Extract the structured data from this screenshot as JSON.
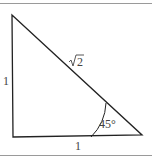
{
  "diagram": {
    "type": "right-triangle",
    "vertices": {
      "top_left": [
        12,
        15
      ],
      "bottom_left": [
        13,
        137
      ],
      "bottom_right": [
        142,
        135
      ]
    },
    "labels": {
      "left_side": "1",
      "bottom_side": "1",
      "hypotenuse_radicand": "2",
      "angle": "45°"
    },
    "colors": {
      "stroke": "#222222",
      "text": "#444444",
      "border": "#9a9a9a"
    }
  }
}
